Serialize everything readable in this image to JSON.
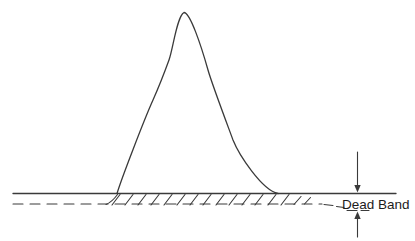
{
  "diagram": {
    "label": {
      "text": "Dead Band"
    },
    "colors": {
      "line": "#3a3a3a",
      "text": "#1c1c1c",
      "background": "#ffffff"
    },
    "icons": {
      "down_arrow": "solid triangle arrowhead pointing down to solid baseline",
      "up_arrow": "solid triangle arrowhead pointing up to dashed threshold line"
    },
    "paths": {
      "peak_curve": "M117 193.5 C121 180 144 120 153 100 C161 82 165 71 169 60 C173 49 177 16 184 12.5 C190 12.5 201 45 208 70 C212 84 226 121 233 140 C239 155 262 190 278 193.5",
      "baseline_solid": "M13 193.5 H396",
      "baseline_dashed": "M13 204 H322",
      "left_transition": "M106 204.5 Q112 202 117.5 194.5",
      "right_transition_dashes": "M324 204.5 L333 205.5 M336.5 206.5 L344 207.5 M347 210.5 H357 M361 210.5 H369",
      "hatch": "M112 205 L120 194.5 M125 205 L133 194.5 M138 205 L146 194.5 M151 205 L159 194.5 M164 205 L172 194.5 M177 205 L185 194.5 M190 205 L198 194.5 M203 205 L211 194.5 M216 205 L224 194.5 M229 205 L237 194.5 M242 205 L250 194.5 M255 205 L263 194.5 M268 205 L276 194.5 M281 205 L289 194.5 M294 204.5 L301 196.5 M304.5 204 L310.5 197.5",
      "arrow_down_shaft": "M357.5 152 V186",
      "arrow_down_head": "M357.5 192.5 L354.3 185 L360.7 185 Z",
      "arrow_up_shaft": "M357.5 237 V219",
      "arrow_up_head": "M357.5 211.5 L354.3 219 L360.7 219 Z"
    }
  }
}
